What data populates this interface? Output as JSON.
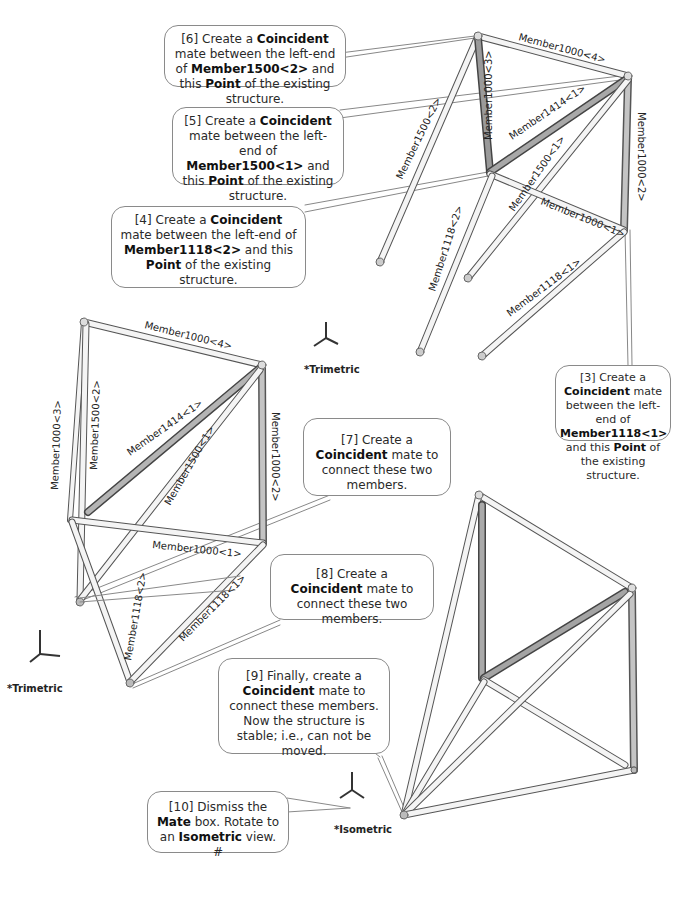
{
  "callouts": {
    "c6": {
      "pre": "[6] Create a ",
      "b1": "Coincident",
      "mid1": " mate between the left-end of ",
      "b2": "Member1500<2>",
      "mid2": " and this ",
      "b3": "Point",
      "post": " of the existing structure."
    },
    "c5": {
      "pre": "[5] Create a ",
      "b1": "Coincident",
      "mid1": " mate between the left-end of ",
      "b2": "Member1500<1>",
      "mid2": " and this ",
      "b3": "Point",
      "post": " of the existing structure."
    },
    "c4": {
      "pre": "[4] Create a ",
      "b1": "Coincident",
      "mid1": " mate between the left-end of ",
      "b2": "Member1118<2>",
      "mid2": " and this ",
      "b3": "Point",
      "post": " of the existing structure."
    },
    "c3": {
      "pre": "[3] Create a ",
      "b1": "Coincident",
      "mid1": " mate between the left-end of ",
      "b2": "Member1118<1>",
      "mid2": " and this ",
      "b3": "Point",
      "post": " of the existing structure."
    },
    "c7": {
      "pre": "[7] Create a ",
      "b1": "Coincident",
      "post": " mate to connect these two members."
    },
    "c8": {
      "pre": "[8] Create a ",
      "b1": "Coincident",
      "post": " mate to connect these two members."
    },
    "c9": {
      "pre": "[9] Finally, create a ",
      "b1": "Coincident",
      "post": " mate to connect these members.  Now the structure is stable; i.e., can not be moved."
    },
    "c10": {
      "pre": "[10] Dismiss the ",
      "b1": "Mate",
      "mid1": " box.  Rotate to an ",
      "b2": "Isometric",
      "post": " view. #"
    }
  },
  "views": {
    "top": {
      "orientation": "*Trimetric",
      "members": [
        "Member1000<4>",
        "Member1000<3>",
        "Member1414<1>",
        "Member1500<2>",
        "Member1000<2>",
        "Member1500<1>",
        "Member1000<1>",
        "Member1118<2>",
        "Member1118<1>"
      ]
    },
    "middle": {
      "orientation": "*Trimetric",
      "members": [
        "Member1000<4>",
        "Member1000<3>",
        "Member1500<2>",
        "Member1414<1>",
        "Member1500<1>",
        "Member1000<2>",
        "Member1000<1>",
        "Member1118<2>",
        "Member1118<1>"
      ]
    },
    "bottom": {
      "orientation": "*Isometric"
    }
  },
  "axes": {
    "x": "X",
    "y": "Y",
    "z": "Z"
  }
}
